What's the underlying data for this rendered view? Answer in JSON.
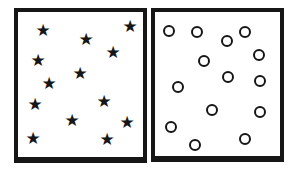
{
  "figure": {
    "kind": "two-panel shape comparison figure",
    "colors": {
      "ink": "#161616",
      "panel_bg": "#ffffff",
      "page_bg": "#ffffff"
    },
    "glyphs": {
      "star": "★"
    }
  },
  "panels": [
    {
      "id": "left",
      "shape": "star",
      "count": 13,
      "items": [
        {
          "x": 25,
          "y": 19
        },
        {
          "x": 68,
          "y": 28
        },
        {
          "x": 112,
          "y": 15
        },
        {
          "x": 95,
          "y": 41
        },
        {
          "x": 20,
          "y": 49
        },
        {
          "x": 62,
          "y": 62
        },
        {
          "x": 31,
          "y": 72
        },
        {
          "x": 86,
          "y": 90
        },
        {
          "x": 17,
          "y": 93
        },
        {
          "x": 54,
          "y": 109
        },
        {
          "x": 109,
          "y": 111
        },
        {
          "x": 15,
          "y": 127
        },
        {
          "x": 89,
          "y": 128
        }
      ]
    },
    {
      "id": "right",
      "shape": "circle",
      "count": 14,
      "items": [
        {
          "x": 14,
          "y": 19
        },
        {
          "x": 42,
          "y": 20
        },
        {
          "x": 72,
          "y": 29
        },
        {
          "x": 90,
          "y": 20
        },
        {
          "x": 49,
          "y": 49
        },
        {
          "x": 104,
          "y": 43
        },
        {
          "x": 73,
          "y": 65
        },
        {
          "x": 23,
          "y": 75
        },
        {
          "x": 105,
          "y": 69
        },
        {
          "x": 57,
          "y": 98
        },
        {
          "x": 105,
          "y": 100
        },
        {
          "x": 16,
          "y": 115
        },
        {
          "x": 40,
          "y": 133
        },
        {
          "x": 90,
          "y": 127
        }
      ]
    }
  ]
}
